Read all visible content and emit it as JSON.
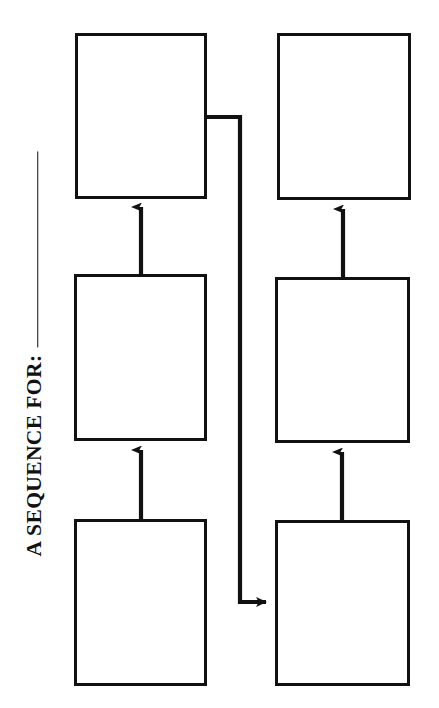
{
  "worksheet": {
    "title_label": "A SEQUENCE FOR:",
    "blank_line_value": "",
    "ink_color": "#111111",
    "paper_color": "#ffffff",
    "orientation": "rotated-90-ccw"
  },
  "diagram": {
    "type": "flowchart",
    "flow_direction": "serpentine-upward",
    "step_count": 6,
    "boxes": [
      {
        "id": "box-1",
        "label": "",
        "column": "left",
        "row": "bottom",
        "x": 74,
        "y": 519,
        "width": 133,
        "height": 167
      },
      {
        "id": "box-2",
        "label": "",
        "column": "left",
        "row": "middle",
        "x": 74,
        "y": 274,
        "width": 133,
        "height": 167
      },
      {
        "id": "box-3",
        "label": "",
        "column": "left",
        "row": "top",
        "x": 75,
        "y": 33,
        "width": 132,
        "height": 166
      },
      {
        "id": "box-4",
        "label": "",
        "column": "right",
        "row": "bottom",
        "x": 275,
        "y": 520,
        "width": 135,
        "height": 166
      },
      {
        "id": "box-5",
        "label": "",
        "column": "right",
        "row": "middle",
        "x": 275,
        "y": 277,
        "width": 135,
        "height": 166
      },
      {
        "id": "box-6",
        "label": "",
        "column": "right",
        "row": "top",
        "x": 277,
        "y": 33,
        "width": 134,
        "height": 167
      }
    ],
    "connectors": [
      {
        "id": "arrow-1-to-2",
        "from": "box-1",
        "to": "box-2",
        "shape": "straight-up"
      },
      {
        "id": "arrow-2-to-3",
        "from": "box-2",
        "to": "box-3",
        "shape": "straight-up"
      },
      {
        "id": "arrow-3-to-4",
        "from": "box-3",
        "to": "box-4",
        "shape": "elbow-right-down-right"
      },
      {
        "id": "arrow-4-to-5",
        "from": "box-4",
        "to": "box-5",
        "shape": "straight-up"
      },
      {
        "id": "arrow-5-to-6",
        "from": "box-5",
        "to": "box-6",
        "shape": "straight-up"
      }
    ]
  }
}
